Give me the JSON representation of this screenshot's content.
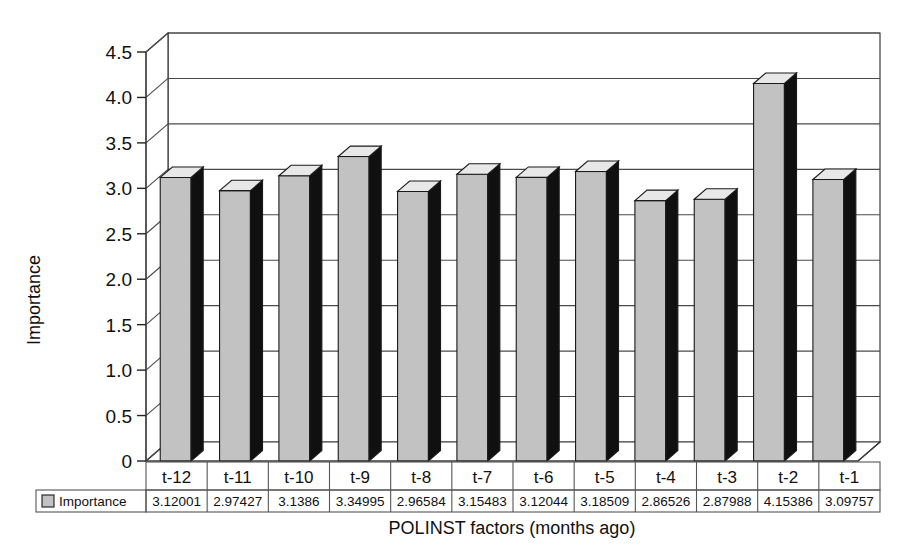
{
  "chart_data": {
    "type": "bar",
    "title": "",
    "subtitle": "",
    "xlabel": "POLINST factors (months ago)",
    "ylabel": "Importance",
    "ylim": [
      0,
      4.5
    ],
    "ytick_step": 0.5,
    "ytick_labels": [
      "0",
      "0.5",
      "1.0",
      "1.5",
      "2.0",
      "2.5",
      "3.0",
      "3.5",
      "4.0",
      "4.5"
    ],
    "ytick_values": [
      0,
      0.5,
      1.0,
      1.5,
      2.0,
      2.5,
      3.0,
      3.5,
      4.0,
      4.5
    ],
    "grid": true,
    "grid_axis": "y",
    "legend": [
      "Importance"
    ],
    "legend_position": "bottom-left-datatable",
    "three_d": true,
    "categories": [
      "t-12",
      "t-11",
      "t-10",
      "t-9",
      "t-8",
      "t-7",
      "t-6",
      "t-5",
      "t-4",
      "t-3",
      "t-2",
      "t-1"
    ],
    "series": [
      {
        "name": "Importance",
        "color": "#c2c2c2",
        "values": [
          3.12001,
          2.97427,
          3.1386,
          3.34995,
          2.96584,
          3.15483,
          3.12044,
          3.18509,
          2.86526,
          2.87988,
          4.15386,
          3.09757
        ],
        "value_labels": [
          "3.12001",
          "2.97427",
          "3.1386",
          "3.34995",
          "2.96584",
          "3.15483",
          "3.12044",
          "3.18509",
          "2.86526",
          "2.87988",
          "4.15386",
          "3.09757"
        ]
      }
    ],
    "data_table": {
      "row_header": "Importance",
      "column_headers": [
        "t-12",
        "t-11",
        "t-10",
        "t-9",
        "t-8",
        "t-7",
        "t-6",
        "t-5",
        "t-4",
        "t-3",
        "t-2",
        "t-1"
      ],
      "row_values": [
        "3.12001",
        "2.97427",
        "3.1386",
        "3.34995",
        "2.96584",
        "3.15483",
        "3.12044",
        "3.18509",
        "2.86526",
        "2.87988",
        "4.15386",
        "3.09757"
      ]
    },
    "colors": {
      "bar_front": "#c2c2c2",
      "bar_side": "#101010",
      "bar_top": "#e8e8e8",
      "bar_outline": "#1a1a1a",
      "gridline": "#4a4a4a",
      "frame": "#3a3a3a",
      "text": "#111111",
      "background": "#ffffff"
    }
  }
}
